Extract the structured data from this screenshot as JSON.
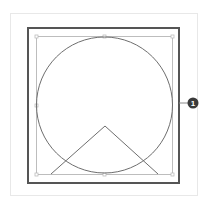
{
  "diagram": {
    "colors": {
      "outer_frame": "#e8e8e8",
      "dark_frame": "#555555",
      "guide_square": "#bdbdbd",
      "circle": "#6e6e6e",
      "triangle": "#6e6e6e",
      "callout_fill": "#3a3a3a",
      "callout_line": "#8a8a8a"
    },
    "callout": {
      "label": "1"
    }
  }
}
